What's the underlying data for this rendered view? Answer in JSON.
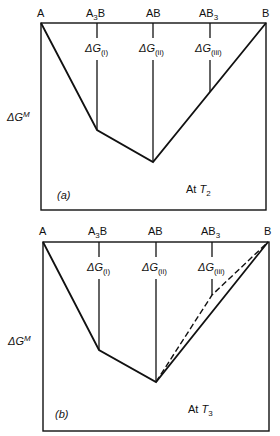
{
  "panels": [
    {
      "id": "a",
      "tag": "(a)",
      "temperature_prefix": "At ",
      "temperature_symbol": "T",
      "temperature_sub": "2",
      "y_axis_label": "ΔG",
      "y_axis_sup": "M",
      "compositions": [
        {
          "label": "A",
          "sub": "",
          "label2": ""
        },
        {
          "label": "A",
          "sub": "3",
          "label2": "B"
        },
        {
          "label": "AB",
          "sub": "",
          "label2": ""
        },
        {
          "label": "AB",
          "sub": "3",
          "label2": ""
        },
        {
          "label": "B",
          "sub": "",
          "label2": ""
        }
      ],
      "delta_g_labels": [
        {
          "symbol": "ΔG",
          "sub": "(i)"
        },
        {
          "symbol": "ΔG",
          "sub": "(ii)"
        },
        {
          "symbol": "ΔG",
          "sub": "(iii)"
        }
      ],
      "hull": "AB3 lies on the AB–B tangent line"
    },
    {
      "id": "b",
      "tag": "(b)",
      "temperature_prefix": "At ",
      "temperature_symbol": "T",
      "temperature_sub": "3",
      "y_axis_label": "ΔG",
      "y_axis_sup": "M",
      "compositions": [
        {
          "label": "A",
          "sub": "",
          "label2": ""
        },
        {
          "label": "A",
          "sub": "3",
          "label2": "B"
        },
        {
          "label": "AB",
          "sub": "",
          "label2": ""
        },
        {
          "label": "AB",
          "sub": "3",
          "label2": ""
        },
        {
          "label": "B",
          "sub": "",
          "label2": ""
        }
      ],
      "delta_g_labels": [
        {
          "symbol": "ΔG",
          "sub": "(i)"
        },
        {
          "symbol": "ΔG",
          "sub": "(ii)"
        },
        {
          "symbol": "ΔG",
          "sub": "(iii)"
        }
      ],
      "hull": "AB3 lies above the AB–B tangent (dashed line shows AB–AB3–B)"
    }
  ]
}
